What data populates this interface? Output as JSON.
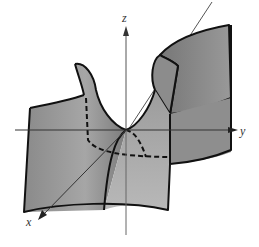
{
  "diagram": {
    "type": "3d-surface",
    "axes": {
      "z": {
        "label": "z"
      },
      "y": {
        "label": "y"
      },
      "x": {
        "label": "x"
      }
    },
    "colors": {
      "surface_fill": "#8f8f8f",
      "surface_light": "#b4b4b4",
      "outline": "#111111",
      "axis": "#444444",
      "background": "#ffffff"
    },
    "curves": [
      "solid cross-section curve",
      "dashed hidden trace curves"
    ]
  }
}
